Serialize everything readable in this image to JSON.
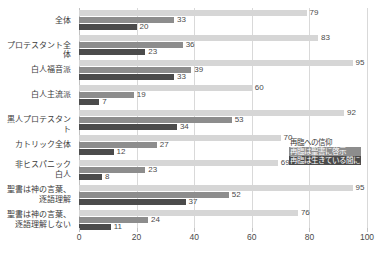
{
  "chart_data": {
    "type": "bar",
    "orientation": "horizontal",
    "title": "",
    "xlabel": "",
    "ylabel": "",
    "xlim": [
      0,
      100
    ],
    "xticks": [
      0,
      20,
      40,
      60,
      80,
      100
    ],
    "grid": true,
    "legend_position": "right-middle",
    "categories": [
      "全体",
      "プロテスタント全体",
      "白人福音派",
      "白人主流派",
      "黒人プロテスタント",
      "カトリック全体",
      "非ヒスパニック\n白人",
      "聖書は神の言葉、\n逐語理解",
      "聖書は神の言葉、\n逐語理解しない"
    ],
    "series": [
      {
        "name": "再臨への信仰",
        "color": "#d6d6d6",
        "values": [
          79,
          83,
          95,
          60,
          92,
          70,
          69,
          95,
          76
        ]
      },
      {
        "name": "再臨は聖書に啓示",
        "color": "#8d8d8d",
        "values": [
          33,
          36,
          39,
          19,
          53,
          27,
          23,
          52,
          24
        ]
      },
      {
        "name": "再臨は生きている間に",
        "color": "#4b4b4b",
        "values": [
          20,
          23,
          33,
          7,
          34,
          12,
          8,
          37,
          11
        ]
      }
    ]
  },
  "caption": ""
}
